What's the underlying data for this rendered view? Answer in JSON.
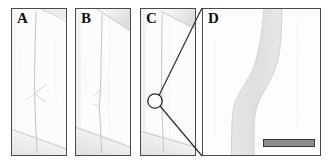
{
  "figure": {
    "type": "micrograph-panel-figure",
    "background_color": "#ffffff",
    "panel_border_color": "#4a4a4a",
    "specimen_color": "#fbfbfb",
    "crack_line_color": "#c9c9c9",
    "crack_band_color": "#e4e4e4",
    "callout_line_color": "#2b2b2b"
  },
  "panels": [
    {
      "id": "panel-a",
      "label": "A",
      "description": "micrograph of specimen with near-vertical crack and branching arrow-shaped secondary crack, plus diagonal boundary at lower left",
      "features": [
        "vertical-crack",
        "branch-crack",
        "lower-diagonal-edge",
        "upper-diagonal-edge"
      ]
    },
    {
      "id": "panel-b",
      "label": "B",
      "description": "micrograph of specimen with near-vertical crack, small kink midway, diagonal shading band at upper right and lower left",
      "features": [
        "vertical-crack",
        "kink",
        "upper-right-diagonal-edge",
        "lower-left-diagonal-edge"
      ]
    },
    {
      "id": "panel-c",
      "label": "C",
      "description": "micrograph of specimen with near-vertical crack; circular region of interest marked for magnification",
      "features": [
        "vertical-crack",
        "region-of-interest-circle",
        "upper-right-diagonal-edge",
        "lower-diagonal-edge"
      ]
    },
    {
      "id": "panel-d",
      "label": "D",
      "description": "high magnification view of the circled region in panel C showing an S-shaped crack band",
      "features": [
        "s-shaped-crack-band",
        "scale-bar"
      ]
    }
  ],
  "callout": {
    "source_panel": "panel-c",
    "target_panel": "panel-d",
    "marker_shape": "circle",
    "marker_center": {
      "x": 155,
      "y": 101
    },
    "marker_radius": 7,
    "line_color": "#2b2b2b"
  },
  "scale_bar": {
    "panel": "panel-d",
    "label": "",
    "fill_color": "#8c8c8c",
    "border_color": "#3a3a3a",
    "width_px": 52,
    "height_px": 8
  }
}
